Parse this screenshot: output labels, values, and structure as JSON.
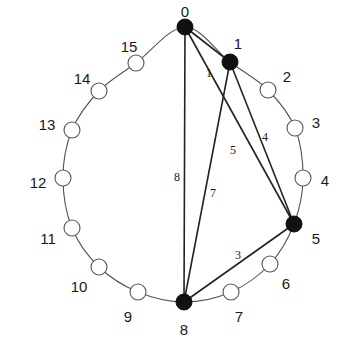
{
  "diagram": {
    "type": "ring-graph",
    "ring": {
      "cx": 183,
      "cy": 165,
      "rx": 121,
      "ry": 138
    },
    "nodes": [
      {
        "id": "0",
        "x": 185,
        "y": 27,
        "filled": true,
        "label": "0",
        "lx": 185,
        "ly": 13
      },
      {
        "id": "1",
        "x": 230,
        "y": 62,
        "filled": true,
        "label": "1",
        "lx": 238,
        "ly": 45
      },
      {
        "id": "2",
        "x": 268,
        "y": 90,
        "filled": false,
        "label": "2",
        "lx": 287,
        "ly": 78
      },
      {
        "id": "3",
        "x": 295,
        "y": 128,
        "filled": false,
        "label": "3",
        "lx": 316,
        "ly": 124
      },
      {
        "id": "4",
        "x": 303,
        "y": 178,
        "filled": false,
        "label": "4",
        "lx": 325,
        "ly": 182
      },
      {
        "id": "5",
        "x": 294,
        "y": 224,
        "filled": true,
        "label": "5",
        "lx": 316,
        "ly": 240
      },
      {
        "id": "6",
        "x": 270,
        "y": 264,
        "filled": false,
        "label": "6",
        "lx": 286,
        "ly": 285
      },
      {
        "id": "7",
        "x": 231,
        "y": 292,
        "filled": false,
        "label": "7",
        "lx": 239,
        "ly": 318
      },
      {
        "id": "8",
        "x": 184,
        "y": 302,
        "filled": true,
        "label": "8",
        "lx": 184,
        "ly": 331
      },
      {
        "id": "9",
        "x": 138,
        "y": 292,
        "filled": false,
        "label": "9",
        "lx": 128,
        "ly": 318
      },
      {
        "id": "10",
        "x": 99,
        "y": 267,
        "filled": false,
        "label": "10",
        "lx": 79,
        "ly": 288
      },
      {
        "id": "11",
        "x": 72,
        "y": 228,
        "filled": false,
        "label": "11",
        "lx": 48,
        "ly": 240
      },
      {
        "id": "12",
        "x": 63,
        "y": 178,
        "filled": false,
        "label": "12",
        "lx": 38,
        "ly": 184
      },
      {
        "id": "13",
        "x": 72,
        "y": 130,
        "filled": false,
        "label": "13",
        "lx": 47,
        "ly": 126
      },
      {
        "id": "14",
        "x": 99,
        "y": 91,
        "filled": false,
        "label": "14",
        "lx": 82,
        "ly": 80
      },
      {
        "id": "15",
        "x": 136,
        "y": 63,
        "filled": false,
        "label": "15",
        "lx": 129,
        "ly": 48
      }
    ],
    "edges": [
      {
        "from": "0",
        "to": "1",
        "label": "1",
        "lx": 209,
        "ly": 74
      },
      {
        "from": "0",
        "to": "5",
        "label": "5",
        "lx": 233,
        "ly": 151
      },
      {
        "from": "0",
        "to": "8",
        "label": "8",
        "lx": 177,
        "ly": 178
      },
      {
        "from": "1",
        "to": "5",
        "label": "4",
        "lx": 265,
        "ly": 138
      },
      {
        "from": "1",
        "to": "8",
        "label": "7",
        "lx": 213,
        "ly": 194
      },
      {
        "from": "5",
        "to": "8",
        "label": "3",
        "lx": 238,
        "ly": 256
      }
    ]
  }
}
